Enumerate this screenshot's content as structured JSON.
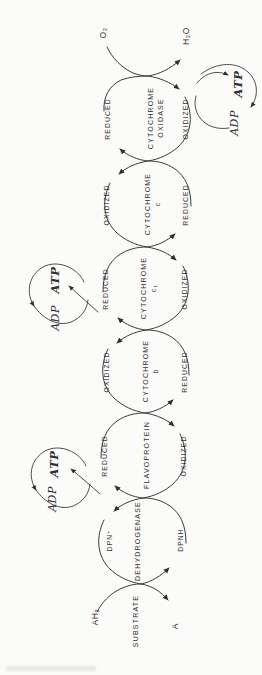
{
  "palette": {
    "background": "#fbfbf9",
    "ink": "#2f2f2f"
  },
  "diagram_title": "respiratory electron transport chain",
  "chain": {
    "top_input": {
      "label": "O₂"
    },
    "top_output": {
      "label": "H₂O"
    },
    "nodes": [
      {
        "line1": "CYTOCHROME",
        "line2": "OXIDASE",
        "left": "REDUCED",
        "right": "OXIDIZED"
      },
      {
        "line1": "CYTOCHROME",
        "line2": "c",
        "left": "OXIDIZED",
        "right": "REDUCED"
      },
      {
        "line1": "CYTOCHROME",
        "line2": "c₁",
        "left": "REDUCED",
        "right": "OXIDIZED"
      },
      {
        "line1": "CYTOCHROME",
        "line2": "b",
        "left": "OXIDIZED",
        "right": "REDUCED"
      },
      {
        "line1": "FLAVOPROTEIN",
        "left": "REDUCED",
        "right": "OXIDIZED"
      },
      {
        "line1": "DEHYDROGENASE",
        "left": "DPN⁺",
        "right": "DPNH"
      }
    ],
    "bottom": {
      "substrate": "SUBSTRATE",
      "input": "AH₂",
      "output": "A"
    }
  },
  "loops": [
    {
      "adp": "ADP",
      "atp": "ATP"
    },
    {
      "adp": "ADP",
      "atp": "ATP"
    },
    {
      "adp": "ADP",
      "atp": "ATP"
    }
  ]
}
